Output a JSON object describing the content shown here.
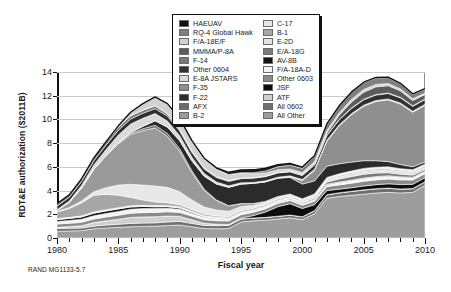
{
  "caption": "RAND MG1133-5.7",
  "chart_data": {
    "type": "area",
    "stacked": true,
    "title": "",
    "xlabel": "Fiscal year",
    "ylabel": "RDT&E authorization ($2011B)",
    "xlim": [
      1980,
      2010
    ],
    "ylim": [
      0,
      14
    ],
    "ytick_step": 2,
    "yticks": [
      "0",
      "2",
      "4",
      "6",
      "8",
      "10",
      "12",
      "14"
    ],
    "xticks": [
      "1980",
      "1985",
      "1990",
      "1995",
      "2000",
      "2005",
      "2010"
    ],
    "xtick_step": 5,
    "xminor_step": 1,
    "grid": "horizontal",
    "legend_position": "top-center",
    "x": [
      1980,
      1981,
      1982,
      1983,
      1984,
      1985,
      1986,
      1987,
      1988,
      1989,
      1990,
      1991,
      1992,
      1993,
      1994,
      1995,
      1996,
      1997,
      1998,
      1999,
      2000,
      2001,
      2002,
      2003,
      2004,
      2005,
      2006,
      2007,
      2008,
      2009,
      2010
    ],
    "series": [
      {
        "name": "All Other",
        "color": "#9d9d9d",
        "values": [
          0.55,
          0.6,
          0.62,
          0.78,
          0.85,
          0.9,
          0.95,
          0.98,
          1.0,
          1.05,
          1.1,
          0.95,
          0.8,
          0.78,
          0.8,
          1.35,
          1.45,
          1.5,
          1.6,
          1.7,
          1.55,
          2.05,
          3.35,
          3.5,
          3.6,
          3.7,
          3.8,
          3.85,
          3.8,
          3.85,
          4.45
        ]
      },
      {
        "name": "All 0602",
        "color": "#6f6f6f",
        "values": [
          0.25,
          0.22,
          0.22,
          0.22,
          0.24,
          0.26,
          0.28,
          0.28,
          0.28,
          0.3,
          0.3,
          0.28,
          0.26,
          0.26,
          0.26,
          0.24,
          0.22,
          0.22,
          0.22,
          0.22,
          0.22,
          0.24,
          0.28,
          0.3,
          0.32,
          0.34,
          0.34,
          0.34,
          0.32,
          0.3,
          0.28
        ]
      },
      {
        "name": "ATF",
        "color": "#cfcfcf",
        "values": [
          0.1,
          0.14,
          0.2,
          0.3,
          0.36,
          0.42,
          0.5,
          0.52,
          0.52,
          0.5,
          0.42,
          0.3,
          0.18,
          0.12,
          0.06,
          0.03,
          0.02,
          0.02,
          0.02,
          0.02,
          0.02,
          0.02,
          0.02,
          0.02,
          0.02,
          0.02,
          0.02,
          0.02,
          0.02,
          0.02,
          0.02
        ]
      },
      {
        "name": "JSF",
        "color": "#0d0d0d",
        "values": [
          0.0,
          0.0,
          0.0,
          0.0,
          0.0,
          0.0,
          0.0,
          0.0,
          0.0,
          0.0,
          0.0,
          0.0,
          0.0,
          0.0,
          0.02,
          0.06,
          0.2,
          0.45,
          0.8,
          0.95,
          0.7,
          0.5,
          0.35,
          0.3,
          0.3,
          0.32,
          0.34,
          0.36,
          0.38,
          0.36,
          0.34
        ]
      },
      {
        "name": "Other 0603",
        "color": "#8a8a8a",
        "values": [
          0.28,
          0.28,
          0.28,
          0.3,
          0.32,
          0.34,
          0.36,
          0.36,
          0.36,
          0.36,
          0.34,
          0.32,
          0.3,
          0.3,
          0.3,
          0.28,
          0.28,
          0.28,
          0.28,
          0.28,
          0.28,
          0.3,
          0.34,
          0.36,
          0.38,
          0.4,
          0.4,
          0.4,
          0.38,
          0.36,
          0.34
        ]
      },
      {
        "name": "F/A-18A-D",
        "color": "#f4f4f4",
        "values": [
          0.22,
          0.24,
          0.26,
          0.28,
          0.3,
          0.32,
          0.34,
          0.34,
          0.32,
          0.3,
          0.26,
          0.22,
          0.18,
          0.14,
          0.12,
          0.1,
          0.1,
          0.1,
          0.1,
          0.1,
          0.1,
          0.12,
          0.16,
          0.2,
          0.22,
          0.24,
          0.24,
          0.24,
          0.22,
          0.2,
          0.18
        ]
      },
      {
        "name": "AV-8B",
        "color": "#141414",
        "values": [
          0.16,
          0.18,
          0.2,
          0.22,
          0.22,
          0.22,
          0.2,
          0.18,
          0.16,
          0.14,
          0.12,
          0.1,
          0.08,
          0.06,
          0.05,
          0.04,
          0.04,
          0.04,
          0.04,
          0.04,
          0.04,
          0.04,
          0.04,
          0.04,
          0.04,
          0.04,
          0.04,
          0.04,
          0.04,
          0.04,
          0.04
        ]
      },
      {
        "name": "E/A-18G",
        "color": "#7a7a7a",
        "values": [
          0.0,
          0.0,
          0.0,
          0.0,
          0.0,
          0.0,
          0.0,
          0.0,
          0.0,
          0.0,
          0.0,
          0.0,
          0.0,
          0.0,
          0.0,
          0.0,
          0.0,
          0.0,
          0.02,
          0.04,
          0.06,
          0.1,
          0.18,
          0.26,
          0.3,
          0.32,
          0.3,
          0.26,
          0.22,
          0.18,
          0.14
        ]
      },
      {
        "name": "E-2D",
        "color": "#e3e3e3",
        "values": [
          0.08,
          0.08,
          0.09,
          0.1,
          0.1,
          0.1,
          0.1,
          0.1,
          0.1,
          0.1,
          0.09,
          0.08,
          0.08,
          0.08,
          0.08,
          0.08,
          0.08,
          0.08,
          0.08,
          0.08,
          0.08,
          0.1,
          0.14,
          0.18,
          0.22,
          0.24,
          0.24,
          0.24,
          0.22,
          0.2,
          0.18
        ]
      },
      {
        "name": "B-1",
        "color": "#a6a6a6",
        "values": [
          0.55,
          0.75,
          1.1,
          1.4,
          1.3,
          1.05,
          0.7,
          0.45,
          0.3,
          0.22,
          0.18,
          0.16,
          0.14,
          0.12,
          0.12,
          0.12,
          0.12,
          0.12,
          0.12,
          0.1,
          0.1,
          0.1,
          0.1,
          0.1,
          0.1,
          0.1,
          0.1,
          0.1,
          0.1,
          0.1,
          0.1
        ]
      },
      {
        "name": "C-17",
        "color": "#e8e8e8",
        "values": [
          0.05,
          0.08,
          0.15,
          0.3,
          0.55,
          0.85,
          1.1,
          1.25,
          1.35,
          1.3,
          1.1,
          0.8,
          0.6,
          0.5,
          0.45,
          0.35,
          0.25,
          0.18,
          0.14,
          0.12,
          0.1,
          0.1,
          0.1,
          0.1,
          0.1,
          0.1,
          0.1,
          0.1,
          0.1,
          0.1,
          0.1
        ]
      },
      {
        "name": "B-2",
        "color": "#9a9a9a",
        "values": [
          0.1,
          0.45,
          1.1,
          1.9,
          2.7,
          3.5,
          4.2,
          4.6,
          4.9,
          4.3,
          3.4,
          2.3,
          1.4,
          0.8,
          0.45,
          0.25,
          0.15,
          0.1,
          0.08,
          0.06,
          0.05,
          0.05,
          0.05,
          0.05,
          0.05,
          0.05,
          0.05,
          0.05,
          0.05,
          0.05,
          0.05
        ]
      },
      {
        "name": "AFX",
        "color": "#6a6a6a",
        "values": [
          0.0,
          0.0,
          0.0,
          0.0,
          0.02,
          0.05,
          0.1,
          0.16,
          0.22,
          0.24,
          0.22,
          0.16,
          0.1,
          0.05,
          0.02,
          0.0,
          0.0,
          0.0,
          0.0,
          0.0,
          0.0,
          0.0,
          0.0,
          0.0,
          0.0,
          0.0,
          0.0,
          0.0,
          0.0,
          0.0,
          0.0
        ]
      },
      {
        "name": "F-22",
        "color": "#2b2b2b",
        "values": [
          0.0,
          0.0,
          0.0,
          0.0,
          0.0,
          0.02,
          0.08,
          0.2,
          0.38,
          0.55,
          0.7,
          0.85,
          1.1,
          1.35,
          1.55,
          1.65,
          1.7,
          1.65,
          1.55,
          1.4,
          1.25,
          1.1,
          0.95,
          0.85,
          0.75,
          0.65,
          0.55,
          0.45,
          0.35,
          0.25,
          0.18
        ]
      },
      {
        "name": "F-35",
        "color": "#8f8f8f",
        "values": [
          0.0,
          0.0,
          0.0,
          0.0,
          0.0,
          0.0,
          0.0,
          0.0,
          0.0,
          0.0,
          0.0,
          0.0,
          0.0,
          0.0,
          0.0,
          0.0,
          0.0,
          0.0,
          0.0,
          0.05,
          0.3,
          0.9,
          2.1,
          3.2,
          4.0,
          4.6,
          5.0,
          5.2,
          5.1,
          4.6,
          4.8
        ]
      },
      {
        "name": "E-8A JSTARS",
        "color": "#dadada",
        "values": [
          0.05,
          0.1,
          0.2,
          0.35,
          0.5,
          0.65,
          0.7,
          0.68,
          0.6,
          0.5,
          0.4,
          0.3,
          0.22,
          0.16,
          0.12,
          0.1,
          0.08,
          0.08,
          0.08,
          0.08,
          0.08,
          0.08,
          0.08,
          0.08,
          0.08,
          0.08,
          0.08,
          0.08,
          0.08,
          0.08,
          0.08
        ]
      },
      {
        "name": "Other 0604",
        "color": "#303030",
        "values": [
          0.3,
          0.32,
          0.34,
          0.36,
          0.38,
          0.4,
          0.42,
          0.42,
          0.42,
          0.42,
          0.4,
          0.4,
          0.38,
          0.38,
          0.38,
          0.36,
          0.36,
          0.36,
          0.36,
          0.34,
          0.34,
          0.36,
          0.4,
          0.42,
          0.44,
          0.46,
          0.46,
          0.46,
          0.44,
          0.42,
          0.4
        ]
      },
      {
        "name": "F-14",
        "color": "#787878",
        "values": [
          0.2,
          0.2,
          0.22,
          0.24,
          0.26,
          0.28,
          0.28,
          0.26,
          0.24,
          0.2,
          0.16,
          0.12,
          0.1,
          0.08,
          0.06,
          0.05,
          0.04,
          0.04,
          0.04,
          0.04,
          0.04,
          0.04,
          0.04,
          0.04,
          0.04,
          0.04,
          0.04,
          0.04,
          0.04,
          0.04,
          0.04
        ]
      },
      {
        "name": "MMMA/P-8A",
        "color": "#5c5c5c",
        "values": [
          0.0,
          0.0,
          0.0,
          0.0,
          0.0,
          0.0,
          0.0,
          0.0,
          0.0,
          0.0,
          0.0,
          0.0,
          0.0,
          0.0,
          0.0,
          0.0,
          0.0,
          0.0,
          0.0,
          0.02,
          0.05,
          0.1,
          0.2,
          0.35,
          0.5,
          0.6,
          0.65,
          0.62,
          0.55,
          0.45,
          0.38
        ]
      },
      {
        "name": "F/A-18E/F",
        "color": "#d2d2d2",
        "values": [
          0.0,
          0.0,
          0.0,
          0.0,
          0.02,
          0.1,
          0.3,
          0.55,
          0.75,
          0.85,
          0.9,
          0.85,
          0.75,
          0.62,
          0.5,
          0.4,
          0.32,
          0.26,
          0.22,
          0.18,
          0.16,
          0.16,
          0.18,
          0.2,
          0.22,
          0.22,
          0.2,
          0.18,
          0.16,
          0.14,
          0.12
        ]
      },
      {
        "name": "RQ-4 Global Hawk",
        "color": "#808080",
        "values": [
          0.0,
          0.0,
          0.0,
          0.0,
          0.0,
          0.0,
          0.0,
          0.0,
          0.0,
          0.0,
          0.0,
          0.0,
          0.0,
          0.0,
          0.02,
          0.05,
          0.1,
          0.18,
          0.26,
          0.32,
          0.36,
          0.42,
          0.5,
          0.55,
          0.58,
          0.58,
          0.55,
          0.5,
          0.44,
          0.38,
          0.34
        ]
      },
      {
        "name": "HAE UAV",
        "color": "#111111",
        "values": [
          0.0,
          0.0,
          0.0,
          0.0,
          0.0,
          0.0,
          0.0,
          0.0,
          0.0,
          0.0,
          0.0,
          0.02,
          0.06,
          0.12,
          0.18,
          0.22,
          0.24,
          0.22,
          0.18,
          0.14,
          0.1,
          0.08,
          0.06,
          0.05,
          0.04,
          0.04,
          0.04,
          0.04,
          0.04,
          0.04,
          0.04
        ]
      }
    ]
  },
  "legend": {
    "col1": [
      {
        "label": "HAEUAV",
        "color": "#111111"
      },
      {
        "label": "RQ-4 Global Hawk",
        "color": "#808080"
      },
      {
        "label": "F/A-18E/F",
        "color": "#d2d2d2"
      },
      {
        "label": "MMMA/P-8A",
        "color": "#5c5c5c"
      },
      {
        "label": "F-14",
        "color": "#787878"
      },
      {
        "label": "Other 0604",
        "color": "#303030"
      },
      {
        "label": "E-8A JSTARS",
        "color": "#dadada"
      },
      {
        "label": "F-35",
        "color": "#8f8f8f"
      },
      {
        "label": "F-22",
        "color": "#2b2b2b"
      },
      {
        "label": "AFX",
        "color": "#6a6a6a"
      },
      {
        "label": "B-2",
        "color": "#9a9a9a"
      }
    ],
    "col2": [
      {
        "label": "C-17",
        "color": "#e8e8e8"
      },
      {
        "label": "B-1",
        "color": "#a6a6a6"
      },
      {
        "label": "E-2D",
        "color": "#e3e3e3"
      },
      {
        "label": "E/A-18G",
        "color": "#7a7a7a"
      },
      {
        "label": "AV-8B",
        "color": "#141414"
      },
      {
        "label": "F/A-18A-D",
        "color": "#f4f4f4"
      },
      {
        "label": "Other 0603",
        "color": "#8a8a8a"
      },
      {
        "label": "JSF",
        "color": "#0d0d0d"
      },
      {
        "label": "ATF",
        "color": "#cfcfcf"
      },
      {
        "label": "All 0602",
        "color": "#6f6f6f"
      },
      {
        "label": "All Other",
        "color": "#9d9d9d"
      }
    ]
  }
}
